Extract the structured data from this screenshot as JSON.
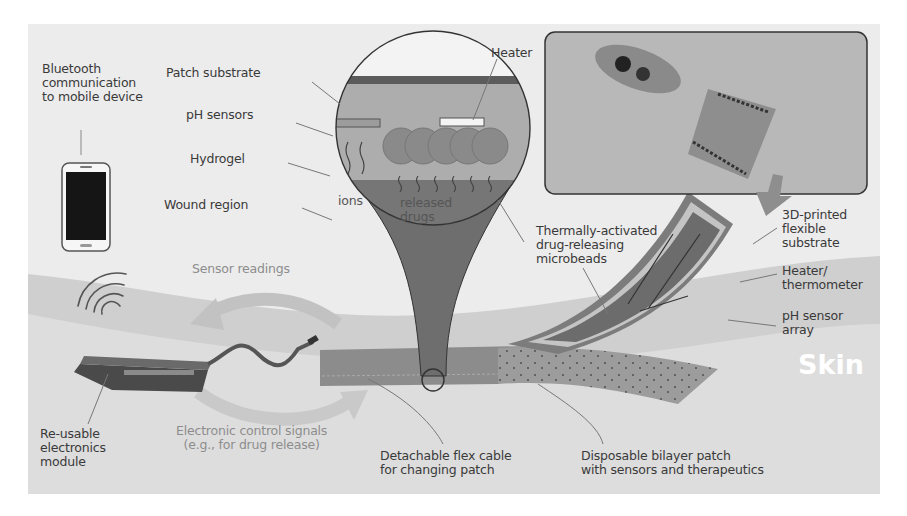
{
  "figure": {
    "type": "schematic"
  },
  "labels": {
    "bluetooth": "Bluetooth\ncommunication\nto mobile device",
    "patch_substrate": "Patch substrate",
    "ph_sensors": "pH sensors",
    "hydrogel": "Hydrogel",
    "wound_region": "Wound region",
    "heater": "Heater",
    "ions": "ions",
    "released_drugs": "released\ndrugs",
    "microbeads": "Thermally-activated\ndrug-releasing\nmicrobeads",
    "flexible_substrate": "3D-printed\nflexible\nsubstrate",
    "heater_thermometer": "Heater/\nthermometer",
    "ph_sensor_array": "pH sensor\narray",
    "skin": "Skin",
    "sensor_readings": "Sensor readings",
    "control_signals": "Electronic control signals\n(e.g., for drug release)",
    "electronics_module": "Re-usable\nelectronics\nmodule",
    "flex_cable": "Detachable flex cable\nfor changing patch",
    "bilayer_patch": "Disposable bilayer patch\nwith sensors and therapeutics"
  },
  "colors": {
    "background": "#ececec",
    "skin": "#cfcfcf",
    "skin_text": "#ffffff",
    "patch": "#8a8a8a",
    "module": "#5a5a5a",
    "arrow": "#bdbdbd",
    "label_text": "#3a3a3a",
    "arrow_label_text": "#8d8d8d",
    "wound": "#7a7a7a",
    "hydrogel": "#b5b5b5"
  }
}
